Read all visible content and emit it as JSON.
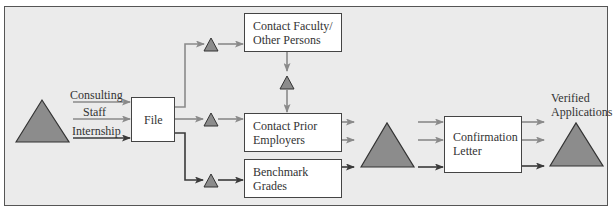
{
  "diagram": {
    "type": "process-flow",
    "colors": {
      "background": "#ebebeb",
      "frame": "#555555",
      "box_fill": "#ffffff",
      "box_border": "#444444",
      "inventory_triangle": "#8c8c8c",
      "arrow_light": "#8a8a8a",
      "arrow_dark": "#3a3a3a",
      "text": "#333333"
    },
    "inputs": [
      {
        "label": "Consulting"
      },
      {
        "label": "Staff"
      },
      {
        "label": "Internship"
      }
    ],
    "boxes": {
      "file": {
        "label": "File"
      },
      "contact_faculty": {
        "line1": "Contact Faculty/",
        "line2": "Other Persons"
      },
      "contact_prior": {
        "line1": "Contact Prior",
        "line2": "Employers"
      },
      "benchmark": {
        "line1": "Benchmark",
        "line2": "Grades"
      },
      "confirmation": {
        "line1": "Confirmation",
        "line2": "Letter"
      }
    },
    "output": {
      "line1": "Verified",
      "line2": "Applications"
    },
    "inventory_symbol": "triangle"
  }
}
